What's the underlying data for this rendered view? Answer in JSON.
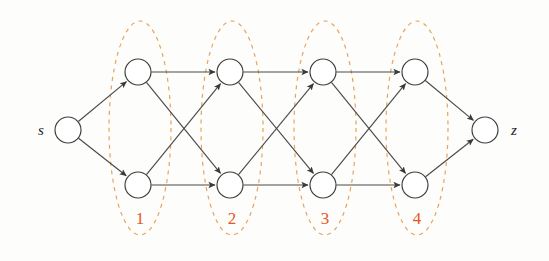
{
  "figure": {
    "background_color": "#fdfdfc",
    "edge_color": "#4a4a4a",
    "node_stroke_color": "#3c3c3c",
    "node_fill_color": "#ffffff",
    "ellipse_color": "#e8a35c",
    "label_color": "#e8551f",
    "terminal_label_color": "#1a1a1a"
  },
  "terminals": {
    "source": {
      "label": "s",
      "cx": 68,
      "cy": 130,
      "r": 13,
      "label_x": 41,
      "label_y": 135
    },
    "sink": {
      "label": "z",
      "cx": 485,
      "cy": 130,
      "r": 13,
      "label_x": 514,
      "label_y": 135
    }
  },
  "stages": [
    {
      "label": "1",
      "ellipse": {
        "cx": 140,
        "cy": 128,
        "rx": 31,
        "ry": 107
      },
      "label_x": 140,
      "label_y": 224,
      "nodes": [
        {
          "id": "n1t",
          "cx": 138,
          "cy": 72,
          "r": 13
        },
        {
          "id": "n1b",
          "cx": 138,
          "cy": 185,
          "r": 13
        }
      ]
    },
    {
      "label": "2",
      "ellipse": {
        "cx": 232,
        "cy": 128,
        "rx": 31,
        "ry": 107
      },
      "label_x": 232,
      "label_y": 224,
      "nodes": [
        {
          "id": "n2t",
          "cx": 230,
          "cy": 72,
          "r": 13
        },
        {
          "id": "n2b",
          "cx": 230,
          "cy": 185,
          "r": 13
        }
      ]
    },
    {
      "label": "3",
      "ellipse": {
        "cx": 325,
        "cy": 128,
        "rx": 31,
        "ry": 107
      },
      "label_x": 325,
      "label_y": 224,
      "nodes": [
        {
          "id": "n3t",
          "cx": 323,
          "cy": 72,
          "r": 13
        },
        {
          "id": "n3b",
          "cx": 323,
          "cy": 185,
          "r": 13
        }
      ]
    },
    {
      "label": "4",
      "ellipse": {
        "cx": 417,
        "cy": 128,
        "rx": 31,
        "ry": 107
      },
      "label_x": 417,
      "label_y": 224,
      "nodes": [
        {
          "id": "n4t",
          "cx": 415,
          "cy": 72,
          "r": 13
        },
        {
          "id": "n4b",
          "cx": 415,
          "cy": 185,
          "r": 13
        }
      ]
    }
  ],
  "edges": [
    {
      "from": "s",
      "to": "n1t",
      "directed": true
    },
    {
      "from": "s",
      "to": "n1b",
      "directed": true
    },
    {
      "from": "n1t",
      "to": "n2t",
      "directed": true
    },
    {
      "from": "n1t",
      "to": "n2b",
      "directed": true
    },
    {
      "from": "n1b",
      "to": "n2t",
      "directed": true
    },
    {
      "from": "n1b",
      "to": "n2b",
      "directed": true
    },
    {
      "from": "n2t",
      "to": "n3t",
      "directed": true
    },
    {
      "from": "n2t",
      "to": "n3b",
      "directed": true
    },
    {
      "from": "n2b",
      "to": "n3t",
      "directed": true
    },
    {
      "from": "n2b",
      "to": "n3b",
      "directed": true
    },
    {
      "from": "n3t",
      "to": "n4t",
      "directed": true
    },
    {
      "from": "n3t",
      "to": "n4b",
      "directed": true
    },
    {
      "from": "n3b",
      "to": "n4t",
      "directed": true
    },
    {
      "from": "n3b",
      "to": "n4b",
      "directed": true
    },
    {
      "from": "n4t",
      "to": "z",
      "directed": true
    },
    {
      "from": "n4b",
      "to": "z",
      "directed": true
    }
  ],
  "chart_data": {
    "type": "diagram",
    "subtype": "trellis-graph",
    "node_count": 10,
    "edge_count": 16,
    "stage_count": 4,
    "nodes_per_stage": 2,
    "stage_labels": [
      "1",
      "2",
      "3",
      "4"
    ],
    "source_label": "s",
    "sink_label": "z"
  }
}
